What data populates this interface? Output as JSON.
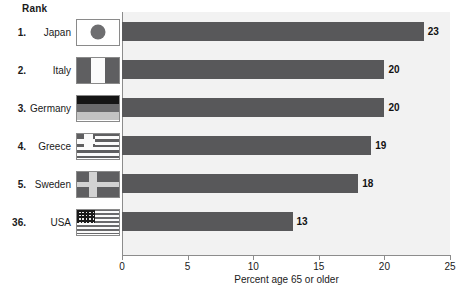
{
  "header": {
    "rank_label": "Rank"
  },
  "chart_data": {
    "type": "bar",
    "orientation": "horizontal",
    "title": "",
    "xlabel": "Percent age 65 or older",
    "ylabel": "",
    "xlim": [
      0,
      25
    ],
    "xticks": [
      "0",
      "5",
      "10",
      "15",
      "20",
      "25"
    ],
    "grid": false,
    "legend": "none",
    "bar_color": "#58585a",
    "plot_background": "#f2f2f2",
    "categories": [
      "Japan",
      "Italy",
      "Germany",
      "Greece",
      "Sweden",
      "USA"
    ],
    "values": [
      23,
      20,
      20,
      19,
      18,
      13
    ],
    "ranks": [
      "1.",
      "2.",
      "3.",
      "4.",
      "5.",
      "36."
    ],
    "rows": [
      {
        "rank": "1.",
        "country": "Japan",
        "value": 23,
        "value_label": "23",
        "flag": "flag-japan"
      },
      {
        "rank": "2.",
        "country": "Italy",
        "value": 20,
        "value_label": "20",
        "flag": "flag-italy"
      },
      {
        "rank": "3.",
        "country": "Germany",
        "value": 20,
        "value_label": "20",
        "flag": "flag-germany"
      },
      {
        "rank": "4.",
        "country": "Greece",
        "value": 19,
        "value_label": "19",
        "flag": "flag-greece"
      },
      {
        "rank": "5.",
        "country": "Sweden",
        "value": 18,
        "value_label": "18",
        "flag": "flag-sweden"
      },
      {
        "rank": "36.",
        "country": "USA",
        "value": 13,
        "value_label": "13",
        "flag": "flag-usa"
      }
    ]
  }
}
